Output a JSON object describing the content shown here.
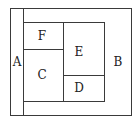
{
  "diagram": {
    "type": "nested-rectangles",
    "labels": {
      "A": "A",
      "B": "B",
      "C": "C",
      "D": "D",
      "E": "E",
      "F": "F"
    },
    "regions": [
      {
        "id": "A",
        "description": "left vertical strip"
      },
      {
        "id": "B",
        "description": "outer surrounding area"
      },
      {
        "id": "F",
        "description": "top-left inner cell"
      },
      {
        "id": "C",
        "description": "bottom-left inner cell"
      },
      {
        "id": "E",
        "description": "top-right inner cell"
      },
      {
        "id": "D",
        "description": "bottom-right inner cell"
      }
    ],
    "colors": {
      "stroke": "#3a3a3a",
      "background": "#ffffff",
      "text": "#222222"
    }
  }
}
